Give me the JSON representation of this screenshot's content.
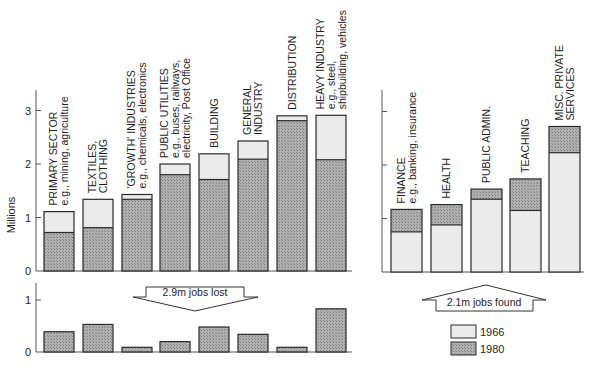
{
  "chart_data": [
    {
      "id": "jobs-lost-sectors",
      "type": "bar",
      "subtype": "overlaid-paired-bars",
      "ylabel": "Millions",
      "ylim": [
        0,
        3.4
      ],
      "yticks": [
        0,
        1,
        2,
        3
      ],
      "grid": false,
      "categories": [
        {
          "label": [
            "PRIMARY SECTOR",
            "e.g., mining, agriculture"
          ]
        },
        {
          "label": [
            "TEXTILES,",
            "CLOTHING"
          ]
        },
        {
          "label": [
            "'GROWTH' INDUSTRIES",
            "e.g., chemicals, electronics"
          ]
        },
        {
          "label": [
            "PUBLIC UTILITIES",
            "e.g., buses, railways,",
            "electricity, Post Office"
          ]
        },
        {
          "label": [
            "BUILDING"
          ]
        },
        {
          "label": [
            "GENERAL",
            "INDUSTRY"
          ]
        },
        {
          "label": [
            "DISTRIBUTION"
          ]
        },
        {
          "label": [
            "HEAVY INDUSTRY",
            "e.g., steel,",
            "shipbuilding, vehicles"
          ]
        }
      ],
      "series": [
        {
          "name": "1966",
          "values": [
            1.11,
            1.34,
            1.43,
            2.0,
            2.19,
            2.43,
            2.9,
            2.91
          ]
        },
        {
          "name": "1980",
          "values": [
            0.72,
            0.81,
            1.34,
            1.8,
            1.71,
            2.09,
            2.81,
            2.08
          ]
        }
      ]
    },
    {
      "id": "jobs-lost-difference",
      "type": "bar",
      "ylim": [
        0,
        1.3
      ],
      "yticks": [
        0,
        1
      ],
      "grid": false,
      "categories": [
        "PRIMARY SECTOR",
        "TEXTILES, CLOTHING",
        "'GROWTH' INDUSTRIES",
        "PUBLIC UTILITIES",
        "BUILDING",
        "GENERAL INDUSTRY",
        "DISTRIBUTION",
        "HEAVY INDUSTRY"
      ],
      "values": [
        0.39,
        0.53,
        0.09,
        0.2,
        0.48,
        0.34,
        0.09,
        0.83
      ],
      "annotation": "2.9m jobs lost"
    },
    {
      "id": "jobs-found-services",
      "type": "bar",
      "subtype": "overlaid-paired-bars",
      "ylim": [
        0,
        3.4
      ],
      "yticks": [
        0,
        1,
        2,
        3
      ],
      "grid": false,
      "categories": [
        {
          "label": [
            "FINANCE",
            "e.g., banking, insurance"
          ]
        },
        {
          "label": [
            "HEALTH"
          ]
        },
        {
          "label": [
            "PUBLIC ADMIN."
          ]
        },
        {
          "label": [
            "TEACHING"
          ]
        },
        {
          "label": [
            "MISC. PRIVATE",
            "SERVICES"
          ]
        }
      ],
      "series": [
        {
          "name": "1966",
          "values": [
            0.75,
            0.88,
            1.36,
            1.15,
            2.23
          ]
        },
        {
          "name": "1980",
          "values": [
            1.17,
            1.26,
            1.55,
            1.74,
            2.72
          ]
        }
      ],
      "annotation": "2.1m jobs found"
    }
  ],
  "legend": {
    "position": "bottom-right",
    "items": [
      {
        "label": "1966",
        "color": "#e6e6e6"
      },
      {
        "label": "1980",
        "color": "#a8a8a8"
      }
    ]
  },
  "colors": {
    "light": "#e6e6e6",
    "dark": "#a8a8a8",
    "outline": "#2a2a2a",
    "axis": "#555555"
  },
  "annotations": {
    "lost": "2.9m jobs lost",
    "found": "2.1m jobs found"
  }
}
